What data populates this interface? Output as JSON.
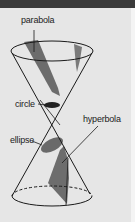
{
  "figure": {
    "labels": {
      "parabola": "parabola",
      "circle": "circle",
      "hyperbola": "hyperbola",
      "ellipse": "ellipse"
    },
    "colors": {
      "background": "#e6e6e6",
      "topbar": "#3a3a3a",
      "section_fill": "#6a6a6a",
      "outline": "#1a1a1a"
    }
  }
}
